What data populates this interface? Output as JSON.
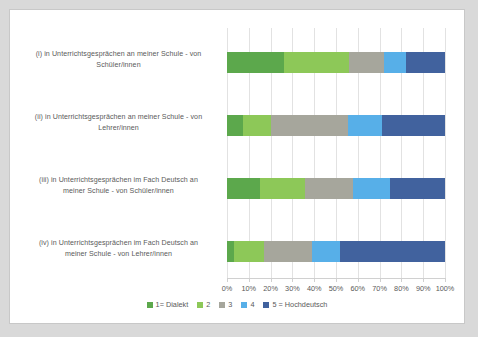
{
  "chart_data": {
    "type": "bar",
    "orientation": "horizontal",
    "stacked": true,
    "normalized_percent": true,
    "title": "",
    "xlabel": "",
    "ylabel": "",
    "xlim": [
      0,
      100
    ],
    "grid": true,
    "legend_position": "bottom",
    "categories": [
      "(i) in Unterrichtsgesprächen an meiner Schule - von Schüler/innen",
      "(ii) in Unterrichtsgesprächen an meiner Schule - von Lehrer/innen",
      "(iii) in Unterrichtsgesprächen im Fach Deutsch an meiner Schule - von Schüler/innen",
      "(iv) in Unterrichtsgesprächen im Fach Deutsch an meiner Schule - von Lehrer/innen"
    ],
    "category_lines": [
      [
        "(i) in Unterrichtsgesprächen an meiner Schule - von",
        "Schüler/innen"
      ],
      [
        "(ii) in Unterrichtsgesprächen an meiner Schule - von",
        "Lehrer/innen"
      ],
      [
        "(iii) in Unterrichtsgesprächen im Fach Deutsch an",
        "meiner Schule - von Schüler/innen"
      ],
      [
        "(iv) in Unterrichtsgesprächen im Fach Deutsch an",
        "meiner Schule - von Lehrer/innen"
      ]
    ],
    "series": [
      {
        "name": "1= Dialekt",
        "color": "#5ca84c",
        "values": [
          26,
          7.5,
          15,
          3
        ]
      },
      {
        "name": "2",
        "color": "#8dc858",
        "values": [
          30,
          12.5,
          21,
          14
        ]
      },
      {
        "name": "3",
        "color": "#a6a69c",
        "values": [
          16,
          35.5,
          22,
          22
        ]
      },
      {
        "name": "4",
        "color": "#57afe8",
        "values": [
          10,
          15.5,
          17,
          13
        ]
      },
      {
        "name": "5 = Hochdeutsch",
        "color": "#41629e",
        "values": [
          18,
          29,
          25,
          48
        ]
      }
    ],
    "xticks": [
      "0%",
      "10%",
      "20%",
      "30%",
      "40%",
      "50%",
      "60%",
      "70%",
      "80%",
      "90%",
      "100%"
    ],
    "xtick_values": [
      0,
      10,
      20,
      30,
      40,
      50,
      60,
      70,
      80,
      90,
      100
    ]
  },
  "colors": {
    "page_background": "#d9d9d9",
    "panel_background": "#ffffff",
    "panel_border": "#c8c8c8",
    "gridline": "#e2e2e2",
    "axis": "#d0d0d0",
    "text": "#5a5a5a"
  }
}
